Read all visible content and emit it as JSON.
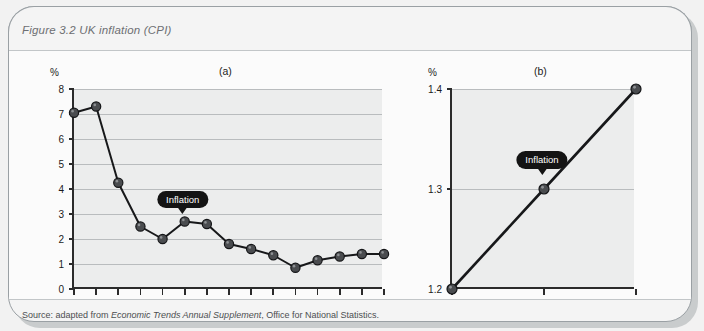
{
  "figure": {
    "title": "Figure 3.2  UK inflation (CPI)",
    "source_prefix": "Source: adapted from ",
    "source_italic": "Economic Trends Annual Supplement",
    "source_suffix": ", Office for National Statistics.",
    "accent_color": "#141414",
    "plot_bg_color": "#eceded",
    "grid_color": "#b9bcbe",
    "axis_color": "#2b2b2b"
  },
  "chart_data": [
    {
      "type": "line",
      "id": "a",
      "title": "(a)",
      "ylabel": "%",
      "xlabel": "",
      "annotation": "Inflation",
      "annotation_at_x": 1995,
      "ylim": [
        0,
        8
      ],
      "yticks": [
        0,
        1,
        2,
        3,
        4,
        5,
        6,
        7,
        8
      ],
      "ytick_labels": [
        "0",
        "1",
        "2",
        "3",
        "4",
        "5",
        "6",
        "7",
        "8"
      ],
      "grid": true,
      "xlim": [
        1990,
        2004
      ],
      "x": [
        1990,
        1991,
        1992,
        1993,
        1994,
        1995,
        1996,
        1997,
        1998,
        1999,
        2000,
        2001,
        2002,
        2003,
        2004
      ],
      "xtick_labels": [
        "1990",
        "",
        "",
        "",
        "",
        "95",
        "",
        "",
        "",
        "",
        "2000",
        "",
        "",
        "",
        "04"
      ],
      "values": [
        7.05,
        7.3,
        4.25,
        2.5,
        2.0,
        2.7,
        2.6,
        1.8,
        1.6,
        1.35,
        0.85,
        1.15,
        1.3,
        1.4,
        1.4
      ],
      "series_name": "Inflation",
      "legend_position": "none"
    },
    {
      "type": "line",
      "id": "b",
      "title": "(b)",
      "ylabel": "%",
      "xlabel": "",
      "annotation": "Inflation",
      "annotation_at_x": 2002,
      "ylim": [
        1.2,
        1.4
      ],
      "yticks": [
        1.2,
        1.3,
        1.4
      ],
      "ytick_labels": [
        "1.2",
        "1.3",
        "1.4"
      ],
      "grid": true,
      "xlim": [
        2001,
        2003
      ],
      "x": [
        2001,
        2002,
        2003
      ],
      "xtick_labels": [
        "2001",
        "2002",
        "2003"
      ],
      "values": [
        1.2,
        1.3,
        1.4
      ],
      "series_name": "Inflation",
      "legend_position": "none"
    }
  ]
}
